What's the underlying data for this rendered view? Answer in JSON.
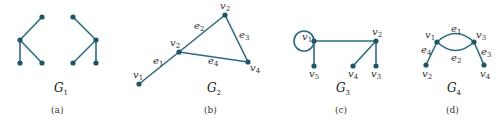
{
  "figure": {
    "panels": [
      {
        "id": "a",
        "caption": "(a)",
        "graph_name": "G",
        "graph_sub": "1",
        "vertices": [],
        "edges": []
      },
      {
        "id": "b",
        "caption": "(b)",
        "graph_name": "G",
        "graph_sub": "2",
        "vertices": [
          {
            "label": "v",
            "sub": "1"
          },
          {
            "label": "v",
            "sub": "2"
          },
          {
            "label": "v",
            "sub": "2"
          },
          {
            "label": "v",
            "sub": "4"
          }
        ],
        "edges": [
          {
            "label": "e",
            "sub": "1"
          },
          {
            "label": "e",
            "sub": "2"
          },
          {
            "label": "e",
            "sub": "3"
          },
          {
            "label": "e",
            "sub": "4"
          }
        ]
      },
      {
        "id": "c",
        "caption": "(c)",
        "graph_name": "G",
        "graph_sub": "3",
        "vertices": [
          {
            "label": "v",
            "sub": "1"
          },
          {
            "label": "v",
            "sub": "2"
          },
          {
            "label": "v",
            "sub": "5"
          },
          {
            "label": "v",
            "sub": "4"
          },
          {
            "label": "v",
            "sub": "3"
          }
        ],
        "edges": []
      },
      {
        "id": "d",
        "caption": "(d)",
        "graph_name": "G",
        "graph_sub": "4",
        "vertices": [
          {
            "label": "v",
            "sub": "1"
          },
          {
            "label": "v",
            "sub": "3"
          },
          {
            "label": "v",
            "sub": "2"
          },
          {
            "label": "v",
            "sub": "4"
          }
        ],
        "edges": [
          {
            "label": "e",
            "sub": "1"
          },
          {
            "label": "e",
            "sub": "2"
          },
          {
            "label": "e",
            "sub": "3"
          },
          {
            "label": "e",
            "sub": "4"
          }
        ]
      }
    ],
    "colors": {
      "edge": "#2d6b80",
      "node": "#1f5567"
    }
  }
}
